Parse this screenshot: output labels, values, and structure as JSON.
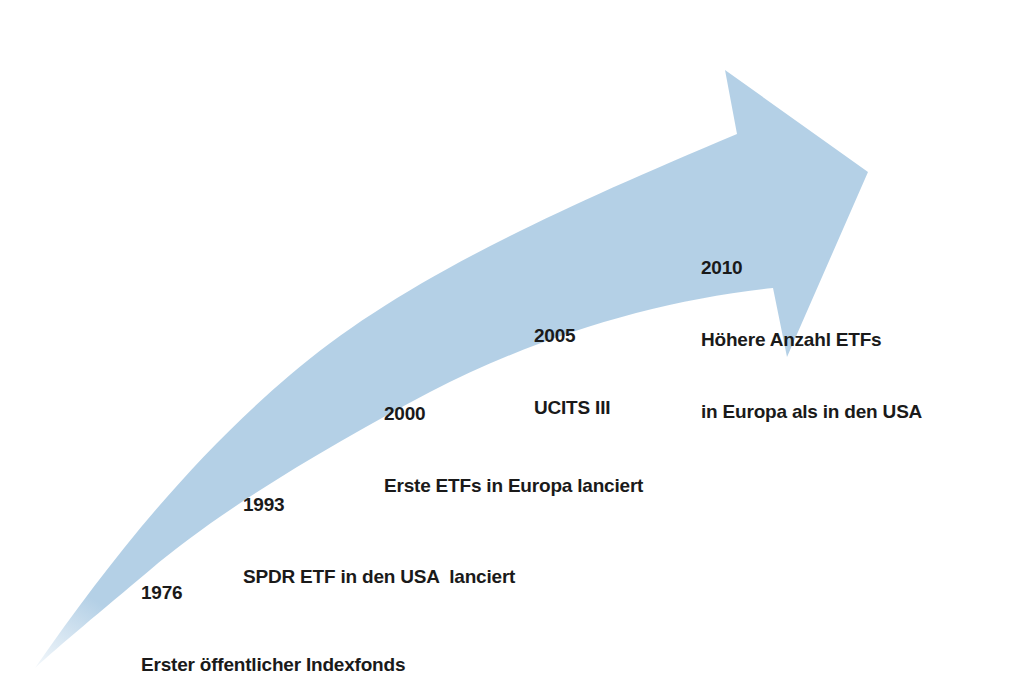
{
  "diagram": {
    "type": "timeline-arrow",
    "arrow_color": "#b4d0e6",
    "text_color": "#1a1a1a",
    "background": "#ffffff",
    "milestones": [
      {
        "year": "1976",
        "lines": [
          "Erster öffentlicher Indexfonds"
        ]
      },
      {
        "year": "1993",
        "lines": [
          "SPDR ETF in den USA  lanciert"
        ]
      },
      {
        "year": "2000",
        "lines": [
          "Erste ETFs in Europa lanciert"
        ]
      },
      {
        "year": "2005",
        "lines": [
          "UCITS III"
        ]
      },
      {
        "year": "2010",
        "lines": [
          "Höhere Anzahl ETFs",
          "in Europa als in den USA"
        ]
      }
    ]
  }
}
